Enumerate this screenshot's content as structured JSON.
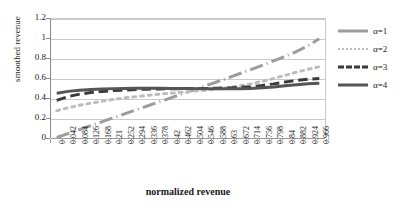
{
  "chart_data": {
    "type": "line",
    "title": "",
    "xlabel": "normalized revenue",
    "ylabel": "smoothed revenue",
    "xlim": [
      0,
      0.966
    ],
    "ylim": [
      0,
      1.2
    ],
    "grid": true,
    "legend_position": "right",
    "y_ticks": [
      "0",
      "0.2",
      "0.4",
      "0.6",
      "0.8",
      "1",
      "1.2"
    ],
    "y_tick_values": [
      0,
      0.2,
      0.4,
      0.6,
      0.8,
      1,
      1.2
    ],
    "categories": [
      "0",
      "0.042",
      "0.084",
      "0.126",
      "0.168",
      "0.21",
      "0.252",
      "0.294",
      "0.336",
      "0.378",
      "0.42",
      "0.462",
      "0.504",
      "0.546",
      "0.588",
      "0.63",
      "0.672",
      "0.714",
      "0.756",
      "0.798",
      "0.84",
      "0.882",
      "0.924",
      "0.966"
    ],
    "x": [
      0,
      0.042,
      0.084,
      0.126,
      0.168,
      0.21,
      0.252,
      0.294,
      0.336,
      0.378,
      0.42,
      0.462,
      0.504,
      0.546,
      0.588,
      0.63,
      0.672,
      0.714,
      0.756,
      0.798,
      0.84,
      0.882,
      0.924,
      0.966
    ],
    "series": [
      {
        "name": "α=1",
        "color": "#9c9c9c",
        "style": "dashdot",
        "width": 3,
        "values": [
          0.005,
          0.045,
          0.085,
          0.125,
          0.165,
          0.205,
          0.245,
          0.285,
          0.325,
          0.365,
          0.405,
          0.445,
          0.485,
          0.525,
          0.565,
          0.605,
          0.648,
          0.69,
          0.733,
          0.778,
          0.823,
          0.872,
          0.93,
          1.0
        ]
      },
      {
        "name": "α=2",
        "color": "#bdbdbd",
        "style": "dotted",
        "width": 3,
        "values": [
          0.275,
          0.305,
          0.33,
          0.352,
          0.372,
          0.39,
          0.405,
          0.418,
          0.43,
          0.442,
          0.452,
          0.462,
          0.472,
          0.482,
          0.494,
          0.508,
          0.524,
          0.546,
          0.572,
          0.6,
          0.632,
          0.664,
          0.692,
          0.718
        ]
      },
      {
        "name": "α=3",
        "color": "#3a3a3a",
        "style": "dashed",
        "width": 3,
        "values": [
          0.38,
          0.418,
          0.442,
          0.458,
          0.47,
          0.478,
          0.484,
          0.489,
          0.492,
          0.495,
          0.497,
          0.498,
          0.499,
          0.5,
          0.502,
          0.505,
          0.51,
          0.518,
          0.53,
          0.546,
          0.565,
          0.58,
          0.592,
          0.6
        ]
      },
      {
        "name": "α=4",
        "color": "#555555",
        "style": "solid",
        "width": 3,
        "values": [
          0.452,
          0.47,
          0.482,
          0.49,
          0.495,
          0.498,
          0.5,
          0.501,
          0.501,
          0.501,
          0.5,
          0.499,
          0.498,
          0.497,
          0.496,
          0.496,
          0.497,
          0.5,
          0.506,
          0.515,
          0.527,
          0.538,
          0.547,
          0.553
        ]
      }
    ]
  },
  "legend": {
    "items": [
      {
        "label": "α=1"
      },
      {
        "label": "α=2"
      },
      {
        "label": "α=3"
      },
      {
        "label": "α=4"
      }
    ]
  }
}
